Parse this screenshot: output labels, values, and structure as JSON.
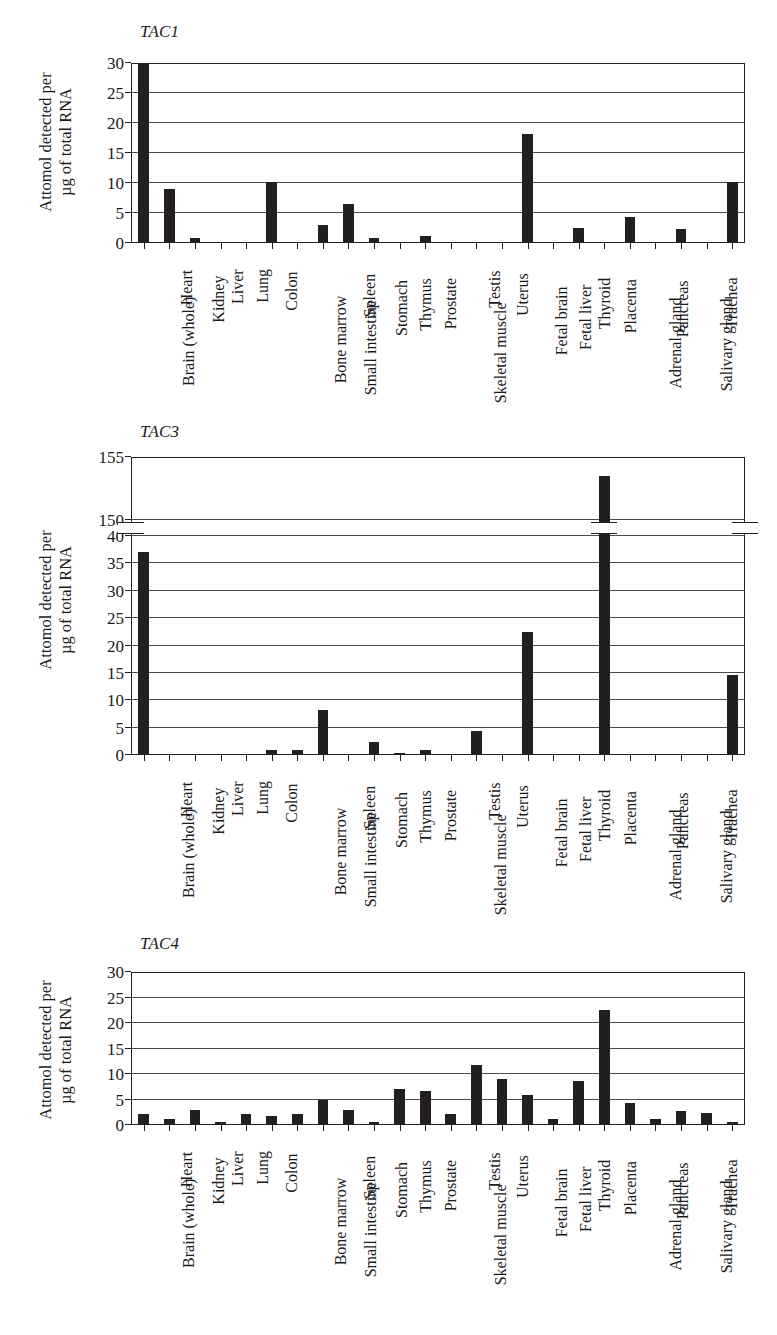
{
  "figure": {
    "y_axis_title_line1": "Attomol detected per",
    "y_axis_title_line2": "µg of total RNA",
    "categories": [
      "Brain (whole)",
      "Heart",
      "Kidney",
      "Liver",
      "Lung",
      "Colon",
      "Bone marrow",
      "Small intestine",
      "Spleen",
      "Stomach",
      "Thymus",
      "Prostate",
      "Skeletal muscle",
      "Testis",
      "Uterus",
      "Fetal brain",
      "Fetal liver",
      "Thyroid",
      "Placenta",
      "Adrenal gland",
      "Pancreas",
      "Salivary gland",
      "Trachea",
      "Mammary gland"
    ],
    "bar_color": "#231f20",
    "axis_color": "#231f20",
    "grid_color": "#4a4a4a"
  },
  "chart_data": [
    {
      "type": "bar",
      "title": "TAC1",
      "xlabel": "",
      "ylabel": "Attomol detected per µg of total RNA",
      "ylim": [
        0,
        30
      ],
      "yticks": [
        0,
        5,
        10,
        15,
        20,
        25,
        30
      ],
      "grid": true,
      "legend": "none",
      "broken_axis": false,
      "categories": [
        "Brain (whole)",
        "Heart",
        "Kidney",
        "Liver",
        "Lung",
        "Colon",
        "Bone marrow",
        "Small intestine",
        "Spleen",
        "Stomach",
        "Thymus",
        "Prostate",
        "Skeletal muscle",
        "Testis",
        "Uterus",
        "Fetal brain",
        "Fetal liver",
        "Thyroid",
        "Placenta",
        "Adrenal gland",
        "Pancreas",
        "Salivary gland",
        "Trachea",
        "Mammary gland"
      ],
      "values": [
        29.8,
        9.0,
        0.9,
        0.05,
        0.05,
        10.1,
        0.25,
        3.0,
        6.5,
        0.8,
        0.15,
        1.1,
        0.1,
        0.25,
        0.25,
        18.1,
        0.05,
        2.5,
        0.1,
        4.3,
        0.1,
        2.4,
        0.2,
        10.2
      ]
    },
    {
      "type": "bar",
      "title": "TAC3",
      "xlabel": "",
      "ylabel": "Attomol detected per µg of total RNA",
      "ylim": [
        0,
        155
      ],
      "yticks": [
        0,
        5,
        10,
        15,
        20,
        25,
        30,
        35,
        40,
        150,
        155
      ],
      "grid": true,
      "legend": "none",
      "broken_axis": true,
      "axis_break": [
        40,
        150
      ],
      "categories": [
        "Brain (whole)",
        "Heart",
        "Kidney",
        "Liver",
        "Lung",
        "Colon",
        "Bone marrow",
        "Small intestine",
        "Spleen",
        "Stomach",
        "Thymus",
        "Prostate",
        "Skeletal muscle",
        "Testis",
        "Uterus",
        "Fetal brain",
        "Fetal liver",
        "Thyroid",
        "Placenta",
        "Adrenal gland",
        "Pancreas",
        "Salivary gland",
        "Trachea",
        "Mammary gland"
      ],
      "values": [
        37.0,
        0.05,
        0.05,
        0.05,
        0.05,
        1.0,
        1.0,
        8.3,
        0.05,
        2.3,
        0.4,
        1.0,
        0.05,
        4.3,
        0.05,
        22.4,
        0.05,
        0.05,
        153.5,
        0.05,
        0.05,
        0.05,
        0.05,
        14.7
      ]
    },
    {
      "type": "bar",
      "title": "TAC4",
      "xlabel": "",
      "ylabel": "Attomol detected per µg of total RNA",
      "ylim": [
        0,
        30
      ],
      "yticks": [
        0,
        5,
        10,
        15,
        20,
        25,
        30
      ],
      "grid": true,
      "legend": "none",
      "broken_axis": false,
      "categories": [
        "Brain (whole)",
        "Heart",
        "Kidney",
        "Liver",
        "Lung",
        "Colon",
        "Bone marrow",
        "Small intestine",
        "Spleen",
        "Stomach",
        "Thymus",
        "Prostate",
        "Skeletal muscle",
        "Testis",
        "Uterus",
        "Fetal brain",
        "Fetal liver",
        "Thyroid",
        "Placenta",
        "Adrenal gland",
        "Pancreas",
        "Salivary gland",
        "Trachea",
        "Mammary gland"
      ],
      "values": [
        2.1,
        1.1,
        2.9,
        0.6,
        2.2,
        1.7,
        2.1,
        4.9,
        2.9,
        0.6,
        7.1,
        6.6,
        2.1,
        11.8,
        9.0,
        5.8,
        1.1,
        8.7,
        22.5,
        4.3,
        1.1,
        2.8,
        2.4,
        0.6
      ]
    }
  ]
}
